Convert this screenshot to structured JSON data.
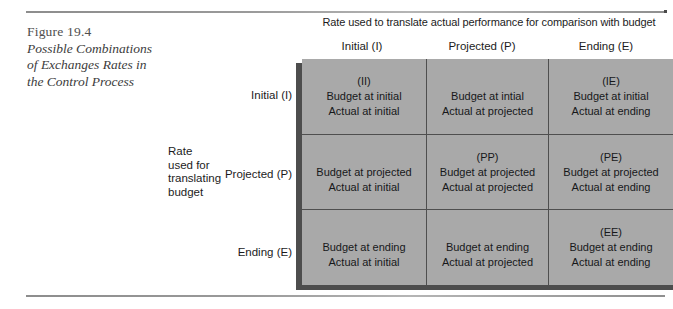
{
  "figure": {
    "number": "Figure 19.4",
    "title_lines": [
      "Possible Combinations",
      "of Exchanges Rates in",
      "the Control Process"
    ]
  },
  "axes": {
    "column_axis_title": "Rate used to translate actual performance for comparison with budget",
    "row_axis_title_lines": [
      "Rate",
      "used for",
      "translating",
      "budget"
    ],
    "column_headers": [
      "Initial (I)",
      "Projected (P)",
      "Ending (E)"
    ],
    "row_headers": [
      "Initial (I)",
      "Projected (P)",
      "Ending (E)"
    ]
  },
  "matrix": {
    "rows": [
      {
        "header": "Initial (I)",
        "cells": [
          {
            "code": "(II)",
            "budget": "Budget at initial",
            "actual": "Actual at initial"
          },
          {
            "code": "",
            "budget": "Budget at intial",
            "actual": "Actual at projected"
          },
          {
            "code": "(IE)",
            "budget": "Budget at initial",
            "actual": "Actual at ending"
          }
        ]
      },
      {
        "header": "Projected (P)",
        "cells": [
          {
            "code": "",
            "budget": "Budget at projected",
            "actual": "Actual at initial"
          },
          {
            "code": "(PP)",
            "budget": "Budget at projected",
            "actual": "Actual at projected"
          },
          {
            "code": "(PE)",
            "budget": "Budget at projected",
            "actual": "Actual at ending"
          }
        ]
      },
      {
        "header": "Ending (E)",
        "cells": [
          {
            "code": "",
            "budget": "Budget at ending",
            "actual": "Actual at initial"
          },
          {
            "code": "",
            "budget": "Budget at ending",
            "actual": "Actual at projected"
          },
          {
            "code": "(EE)",
            "budget": "Budget at ending",
            "actual": "Actual at ending"
          }
        ]
      }
    ]
  },
  "colors": {
    "cell_fill": "#a9a9a9",
    "cell_border": "#4f4f4f",
    "shadow": "#4d4d4d",
    "rule": "#8d8d8d",
    "caption_text": "#4f4f4f",
    "body_text": "#1c1c1c"
  }
}
